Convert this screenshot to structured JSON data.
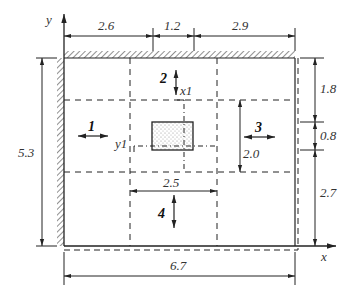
{
  "axes": {
    "x_label": "x",
    "y_label": "y"
  },
  "local_axes": {
    "x1_label": "x1",
    "y1_label": "y1"
  },
  "dimensions": {
    "top": [
      "2.6",
      "1.2",
      "2.9"
    ],
    "right": [
      "1.8",
      "0.8",
      "2.7"
    ],
    "left_total": "5.3",
    "bottom_total": "6.7",
    "inner_height": "2.0",
    "inner_width": "2.5"
  },
  "regions": [
    "1",
    "2",
    "3",
    "4"
  ],
  "colors": {
    "line": "#222222",
    "hatch": "#444444"
  }
}
